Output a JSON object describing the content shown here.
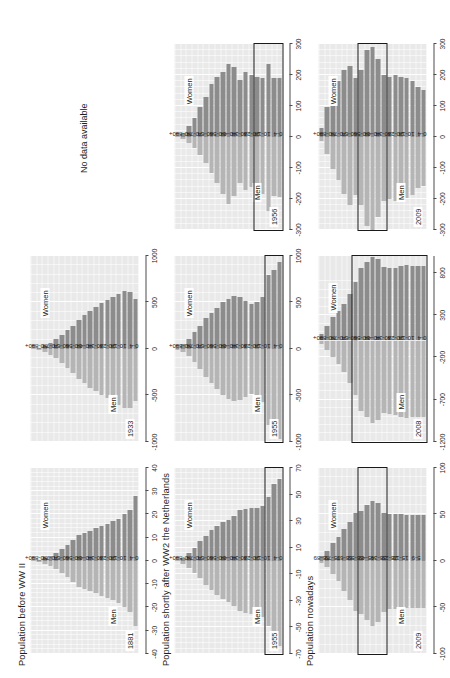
{
  "figure": {
    "row_titles": [
      "Population before WW II",
      "Population shortly after WW2 the Netherlands",
      "Population nowadays"
    ],
    "column_labels": [
      "",
      "USA",
      "(West) Germany"
    ],
    "no_data_text": "No data available",
    "men_label": "Men",
    "women_label": "Women",
    "colors": {
      "women_bar": "#8c8c8c",
      "men_bar": "#b5b5b5",
      "panel_background": "#e9e9e9",
      "grid": "#ffffff",
      "highlight_box": "#1a1a1a",
      "text": "#231f20"
    }
  },
  "chart_data": [
    {
      "id": "nl-1881",
      "type": "bar",
      "title": "Population before WW II",
      "country": "Netherlands",
      "year": "1881",
      "xlabel": "",
      "ylabel": "",
      "grid": true,
      "legend": [
        "Men",
        "Women"
      ],
      "xlim": [
        -40,
        40
      ],
      "xticks": [
        -40,
        -30,
        -20,
        -10,
        0,
        10,
        20,
        30,
        40
      ],
      "xticklabels": [
        "-40",
        "-30",
        "-20",
        "-10",
        "0",
        "10",
        "20",
        "30",
        "40"
      ],
      "categories": [
        "0-4",
        "5-9",
        "10-14",
        "15-19",
        "20-24",
        "25-29",
        "30-34",
        "35-39",
        "40-44",
        "45-49",
        "50-54",
        "55-59",
        "60-64",
        "65-69",
        "70-74",
        "75-79",
        "80-84",
        "85-89",
        "90+"
      ],
      "tick_categories": [
        "0-4",
        "10-14",
        "20-24",
        "30-34",
        "40-44",
        "50-54",
        "60-64",
        "70-74",
        "80-84",
        "90+"
      ],
      "series": [
        {
          "name": "Women",
          "values": [
            28,
            22,
            20,
            18,
            17,
            16,
            15,
            14,
            13,
            12,
            11,
            9,
            7,
            5,
            3.4,
            2,
            1.1,
            0.5,
            0.2
          ]
        },
        {
          "name": "Men",
          "values": [
            -28,
            -22,
            -20,
            -18,
            -17,
            -16,
            -15,
            -14,
            -13,
            -12,
            -11,
            -9,
            -7,
            -5,
            -3.4,
            -2,
            -1.1,
            -0.5,
            -0.2
          ]
        }
      ],
      "highlight": null
    },
    {
      "id": "nl-1955",
      "type": "bar",
      "title": "Population shortly after WW2 the Netherlands",
      "country": "Netherlands",
      "year": "1955",
      "xlabel": "",
      "ylabel": "",
      "grid": true,
      "legend": [
        "Men",
        "Women"
      ],
      "xlim": [
        -70,
        70
      ],
      "xticks": [
        -70,
        -50,
        -30,
        -10,
        10,
        30,
        50,
        70
      ],
      "xticklabels": [
        "-70",
        "-50",
        "-30",
        "-10",
        "10",
        "30",
        "50",
        "70"
      ],
      "categories": [
        "0-4",
        "5-9",
        "10-14",
        "15-19",
        "20-24",
        "25-29",
        "30-34",
        "35-39",
        "40-44",
        "45-49",
        "50-54",
        "55-59",
        "60-64",
        "65-69",
        "70-74",
        "75-79",
        "80-84",
        "85-89",
        "90+"
      ],
      "tick_categories": [
        "0-4",
        "10-14",
        "20-24",
        "30-34",
        "40-44",
        "50-54",
        "60-64",
        "70-74",
        "80-84",
        "90+"
      ],
      "series": [
        {
          "name": "Women",
          "values": [
            62,
            58,
            48,
            41,
            40,
            40,
            39,
            38,
            34,
            31,
            29,
            26,
            23,
            19,
            15,
            10,
            6,
            2.5,
            0.6
          ]
        },
        {
          "name": "Men",
          "values": [
            -64,
            -60,
            -49,
            -42,
            -40,
            -40,
            -39,
            -38,
            -34,
            -31,
            -29,
            -26,
            -22,
            -18,
            -13,
            -9,
            -5,
            -2,
            -0.4
          ]
        }
      ],
      "highlight": {
        "from_category": "0-4",
        "to_category": "10-14"
      }
    },
    {
      "id": "nl-2009",
      "type": "bar",
      "title": "Population nowadays",
      "country": "Netherlands",
      "year": "2009",
      "xlabel": "",
      "ylabel": "",
      "grid": true,
      "legend": [
        "Men",
        "Women"
      ],
      "xlim": [
        -100,
        100
      ],
      "xticks": [
        -100,
        -50,
        0,
        50,
        100
      ],
      "xticklabels": [
        "-100",
        "-50",
        "0",
        "50",
        "100"
      ],
      "categories": [
        "0-4",
        "5-9",
        "10-14",
        "15-19",
        "20-24",
        "25-29",
        "30-34",
        "35-39",
        "40-44",
        "45-49",
        "50-54",
        "55-59",
        "60-64",
        "65-69",
        "70-74",
        "75-79",
        "80-84",
        "85-89",
        "90+"
      ],
      "tick_categories": [
        "5-9",
        "15-19",
        "25-29",
        "35-39",
        "45-49",
        "55-59",
        "65-69",
        "75-79",
        "85-89"
      ],
      "series": [
        {
          "name": "Women",
          "values": [
            49,
            49,
            49,
            49,
            50,
            50,
            50,
            52,
            62,
            65,
            60,
            54,
            52,
            42,
            34,
            26,
            19,
            11,
            5
          ]
        },
        {
          "name": "Men",
          "values": [
            -51,
            -51,
            -51,
            -51,
            -52,
            -52,
            -52,
            -55,
            -66,
            -70,
            -64,
            -57,
            -54,
            -42,
            -32,
            -22,
            -14,
            -7,
            -2
          ]
        }
      ],
      "highlight": {
        "from_category": "35-39",
        "to_category": "55-59"
      }
    },
    {
      "id": "usa-1933",
      "type": "bar",
      "title": "Population before WW II",
      "country": "USA",
      "year": "1933",
      "xlabel": "",
      "ylabel": "",
      "grid": true,
      "legend": [
        "Men",
        "Women"
      ],
      "xlim": [
        -1000,
        1000
      ],
      "xticks": [
        -1000,
        -500,
        0,
        500,
        1000
      ],
      "xticklabels": [
        "-1000",
        "-500",
        "0",
        "500",
        "1000"
      ],
      "categories": [
        "0-4",
        "5-9",
        "10-14",
        "15-19",
        "20-24",
        "25-29",
        "30-34",
        "35-39",
        "40-44",
        "45-49",
        "50-54",
        "55-59",
        "60-64",
        "65-69",
        "70-74",
        "75-79",
        "80-84",
        "85-89",
        "90+"
      ],
      "tick_categories": [
        "0-4",
        "10-14",
        "20-24",
        "30-34",
        "40-44",
        "50-54",
        "60-64",
        "70-74",
        "80-84",
        "90+"
      ],
      "series": [
        {
          "name": "Women",
          "values": [
            540,
            610,
            620,
            590,
            560,
            530,
            490,
            450,
            410,
            360,
            310,
            250,
            200,
            150,
            105,
            65,
            35,
            14,
            4
          ]
        },
        {
          "name": "Men",
          "values": [
            -560,
            -630,
            -640,
            -605,
            -565,
            -530,
            -495,
            -455,
            -420,
            -370,
            -320,
            -260,
            -205,
            -150,
            -100,
            -60,
            -30,
            -11,
            -3
          ]
        }
      ],
      "highlight": null
    },
    {
      "id": "usa-1955",
      "type": "bar",
      "title": "Population shortly after WW2 the Netherlands",
      "country": "USA",
      "year": "1955",
      "xlabel": "",
      "ylabel": "",
      "grid": true,
      "legend": [
        "Men",
        "Women"
      ],
      "xlim": [
        -1000,
        1000
      ],
      "xticks": [
        -1000,
        -500,
        0,
        500,
        1000
      ],
      "xticklabels": [
        "-1000",
        "-500",
        "0",
        "500",
        "1000"
      ],
      "categories": [
        "0-4",
        "5-9",
        "10-14",
        "15-19",
        "20-24",
        "25-29",
        "30-34",
        "35-39",
        "40-44",
        "45-49",
        "50-54",
        "55-59",
        "60-64",
        "65-69",
        "70-74",
        "75-79",
        "80-84",
        "85-89",
        "90+"
      ],
      "tick_categories": [
        "0-4",
        "10-14",
        "20-24",
        "30-34",
        "40-44",
        "50-54",
        "60-64",
        "70-74",
        "80-84",
        "90+"
      ],
      "series": [
        {
          "name": "Women",
          "values": [
            930,
            850,
            790,
            560,
            500,
            480,
            520,
            560,
            570,
            540,
            500,
            440,
            390,
            330,
            250,
            180,
            110,
            48,
            12
          ]
        },
        {
          "name": "Men",
          "values": [
            -965,
            -885,
            -820,
            -575,
            -505,
            -480,
            -515,
            -550,
            -565,
            -535,
            -495,
            -430,
            -370,
            -300,
            -215,
            -145,
            -80,
            -32,
            -7
          ]
        }
      ],
      "highlight": {
        "from_category": "0-4",
        "to_category": "10-14"
      }
    },
    {
      "id": "usa-2008",
      "type": "bar",
      "title": "Population nowadays",
      "country": "USA",
      "year": "2008",
      "xlabel": "",
      "ylabel": "",
      "grid": true,
      "legend": [
        "Men",
        "Women"
      ],
      "xlim": [
        -1200,
        1000
      ],
      "xticks": [
        -1200,
        -700,
        -200,
        300,
        800
      ],
      "xticklabels": [
        "-1200",
        "-700",
        "-200",
        "300",
        "800"
      ],
      "categories": [
        "0-4",
        "5-9",
        "10-14",
        "15-19",
        "20-24",
        "25-29",
        "30-34",
        "35-39",
        "40-44",
        "45-49",
        "50-54",
        "55-59",
        "60-64",
        "65-69",
        "70-74",
        "75-79",
        "80-84",
        "85-89",
        "90+"
      ],
      "tick_categories": [
        "0-4",
        "10-14",
        "20-24",
        "30-34",
        "40-44",
        "50-54",
        "60-64",
        "70-74",
        "80-84",
        "90+"
      ],
      "series": [
        {
          "name": "Women",
          "values": [
            880,
            875,
            885,
            890,
            880,
            855,
            855,
            865,
            960,
            990,
            930,
            860,
            690,
            545,
            430,
            345,
            275,
            175,
            80
          ]
        },
        {
          "name": "Men",
          "values": [
            -905,
            -900,
            -910,
            -915,
            -905,
            -880,
            -865,
            -860,
            -945,
            -975,
            -910,
            -830,
            -650,
            -500,
            -375,
            -280,
            -200,
            -110,
            -40
          ]
        }
      ],
      "highlight": {
        "from_category": "0-4",
        "to_category": "60-64"
      }
    },
    {
      "id": "de-nodata",
      "type": "bar",
      "title": "Population before WW II",
      "country": "(West) Germany",
      "year": "",
      "no_data": true,
      "no_data_text": "No data available"
    },
    {
      "id": "de-1956",
      "type": "bar",
      "title": "Population shortly after WW2 the Netherlands",
      "country": "(West) Germany",
      "year": "1956",
      "xlabel": "",
      "ylabel": "",
      "grid": true,
      "legend": [
        "Men",
        "Women"
      ],
      "xlim": [
        -300,
        300
      ],
      "xticks": [
        -300,
        -200,
        -100,
        0,
        100,
        200,
        300
      ],
      "xticklabels": [
        "-300",
        "-200",
        "-100",
        "0",
        "100",
        "200",
        "300"
      ],
      "categories": [
        "0-4",
        "5-9",
        "10-14",
        "15-19",
        "20-24",
        "25-29",
        "30-34",
        "35-39",
        "40-44",
        "45-49",
        "50-54",
        "55-59",
        "60-64",
        "65-69",
        "70-74",
        "75-79",
        "80-84",
        "85-89",
        "90+"
      ],
      "tick_categories": [
        "0-4",
        "10-14",
        "20-24",
        "30-34",
        "40-44",
        "50-54",
        "60-64",
        "70-74",
        "80-84",
        "90+"
      ],
      "series": [
        {
          "name": "Women",
          "values": [
            190,
            190,
            235,
            190,
            195,
            200,
            210,
            185,
            225,
            235,
            210,
            195,
            170,
            130,
            95,
            62,
            35,
            13,
            3
          ]
        },
        {
          "name": "Men",
          "values": [
            -195,
            -192,
            -238,
            -185,
            -165,
            -160,
            -170,
            -150,
            -190,
            -215,
            -185,
            -150,
            -115,
            -85,
            -58,
            -35,
            -18,
            -6,
            -1
          ]
        }
      ],
      "highlight": {
        "from_category": "0-4",
        "to_category": "20-24"
      }
    },
    {
      "id": "de-2009",
      "type": "bar",
      "title": "Population nowadays",
      "country": "(West) Germany",
      "year": "2009",
      "xlabel": "",
      "ylabel": "",
      "grid": true,
      "legend": [
        "Men",
        "Women"
      ],
      "xlim": [
        -300,
        300
      ],
      "xticks": [
        -300,
        -200,
        -100,
        0,
        100,
        200,
        300
      ],
      "xticklabels": [
        "-300",
        "-200",
        "-100",
        "0",
        "100",
        "200",
        "300"
      ],
      "categories": [
        "0-4",
        "5-9",
        "10-14",
        "15-19",
        "20-24",
        "25-29",
        "30-34",
        "35-39",
        "40-44",
        "45-49",
        "50-54",
        "55-59",
        "60-64",
        "65-69",
        "70-74",
        "75-79",
        "80-84",
        "85-89",
        "90+"
      ],
      "tick_categories": [
        "0-4",
        "10-14",
        "20-24",
        "30-34",
        "40-44",
        "50-54",
        "60-64",
        "70-74",
        "80-84",
        "90+"
      ],
      "series": [
        {
          "name": "Women",
          "values": [
            152,
            160,
            180,
            190,
            195,
            200,
            195,
            200,
            250,
            290,
            280,
            215,
            190,
            230,
            215,
            180,
            155,
            95,
            30
          ]
        },
        {
          "name": "Men",
          "values": [
            -158,
            -166,
            -188,
            -198,
            -205,
            -208,
            -200,
            -205,
            -258,
            -300,
            -288,
            -218,
            -188,
            -218,
            -185,
            -140,
            -105,
            -55,
            -13
          ]
        }
      ],
      "highlight": {
        "from_category": "35-39",
        "to_category": "55-59"
      }
    }
  ]
}
